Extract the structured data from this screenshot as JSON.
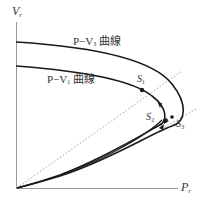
{
  "diagram": {
    "type": "P-V curve diagram",
    "axes": {
      "y": {
        "symbol": "V",
        "subscript": "r"
      },
      "x": {
        "symbol": "P",
        "subscript": "r"
      }
    },
    "curves": [
      {
        "id": "pv3",
        "label_prefix": "P−V",
        "label_subscript": "3",
        "label_suffix": " 曲線",
        "style": "solid"
      },
      {
        "id": "pv1",
        "label_prefix": "P−V",
        "label_subscript": "1",
        "label_suffix": " 曲線",
        "style": "solid"
      }
    ],
    "reference_lines": [
      {
        "id": "load-line-1",
        "style": "dotted",
        "from": "origin",
        "through": "S1"
      },
      {
        "id": "load-line-2",
        "style": "dotted",
        "through": "S2'-S3'"
      }
    ],
    "points": [
      {
        "id": "S1",
        "symbol": "S",
        "subscript": "1",
        "prime": ""
      },
      {
        "id": "S2p",
        "symbol": "S",
        "subscript": "2",
        "prime": "′"
      },
      {
        "id": "S3p",
        "symbol": "S",
        "subscript": "3",
        "prime": "′"
      }
    ],
    "colors": {
      "curve": "#1a1a1a",
      "axis": "#9a9a9a",
      "dotted": "#8a8a8a",
      "text": "#333333"
    }
  }
}
